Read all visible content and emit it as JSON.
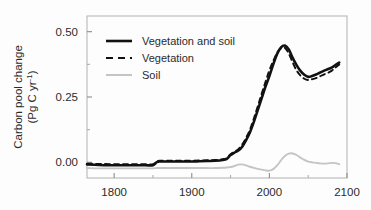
{
  "figure": {
    "background_color": "#fdfdfd",
    "frame_color": "#b9b9b9"
  },
  "axis": {
    "y_title_line1": "Carbon pool change",
    "y_title_line2_pre": "(Pg C yr",
    "y_title_line2_sup": "-1",
    "y_title_line2_post": ")",
    "y_ticks": [
      "0.00",
      "0.25",
      "0.50"
    ],
    "x_ticks": [
      "1800",
      "1900",
      "2000",
      "2100"
    ]
  },
  "legend": {
    "items": [
      {
        "label": "Vegetation and soil",
        "style": "solid",
        "color": "#111111",
        "width": 2.6
      },
      {
        "label": "Vegetation",
        "style": "dashed",
        "color": "#111111",
        "width": 2.0
      },
      {
        "label": "Soil",
        "style": "solid",
        "color": "#c4c4c4",
        "width": 2.0
      }
    ]
  },
  "chart_data": {
    "type": "line",
    "title": "",
    "xlabel": "",
    "ylabel": "Carbon pool change (Pg C yr-1)",
    "xlim": [
      1765,
      2100
    ],
    "ylim": [
      -0.06,
      0.56
    ],
    "grid": false,
    "legend_position": "upper-left-inside",
    "x_major_ticks": [
      1800,
      1900,
      2000,
      2100
    ],
    "x_minor_ticks": [
      1850,
      1950,
      2050
    ],
    "y_major_ticks": [
      0.0,
      0.25,
      0.5
    ],
    "y_minor_ticks": [
      0.125,
      0.375
    ],
    "x": [
      1765,
      1780,
      1795,
      1810,
      1825,
      1840,
      1850,
      1855,
      1860,
      1870,
      1880,
      1890,
      1900,
      1910,
      1920,
      1930,
      1940,
      1945,
      1950,
      1955,
      1960,
      1965,
      1970,
      1975,
      1980,
      1985,
      1990,
      1995,
      2000,
      2005,
      2010,
      2015,
      2020,
      2025,
      2030,
      2035,
      2040,
      2045,
      2050,
      2055,
      2060,
      2065,
      2070,
      2075,
      2080,
      2085,
      2090
    ],
    "series": [
      {
        "name": "Vegetation and soil",
        "style": "solid",
        "color": "#111111",
        "values": [
          -0.008,
          -0.01,
          -0.011,
          -0.011,
          -0.011,
          -0.011,
          -0.011,
          0.001,
          0.003,
          0.003,
          0.003,
          0.003,
          0.003,
          0.004,
          0.005,
          0.006,
          0.009,
          0.013,
          0.028,
          0.037,
          0.045,
          0.06,
          0.085,
          0.115,
          0.155,
          0.2,
          0.245,
          0.29,
          0.33,
          0.375,
          0.415,
          0.44,
          0.447,
          0.432,
          0.4,
          0.372,
          0.35,
          0.335,
          0.327,
          0.33,
          0.336,
          0.343,
          0.35,
          0.356,
          0.362,
          0.372,
          0.382
        ]
      },
      {
        "name": "Vegetation",
        "style": "dashed",
        "color": "#111111",
        "values": [
          -0.005,
          -0.006,
          -0.007,
          -0.007,
          -0.007,
          -0.007,
          -0.007,
          0.004,
          0.006,
          0.006,
          0.006,
          0.006,
          0.006,
          0.007,
          0.008,
          0.009,
          0.012,
          0.016,
          0.031,
          0.041,
          0.05,
          0.068,
          0.094,
          0.125,
          0.168,
          0.214,
          0.262,
          0.308,
          0.352,
          0.388,
          0.42,
          0.436,
          0.438,
          0.416,
          0.382,
          0.352,
          0.332,
          0.32,
          0.315,
          0.318,
          0.322,
          0.329,
          0.336,
          0.342,
          0.35,
          0.362,
          0.374
        ]
      },
      {
        "name": "Soil",
        "style": "solid",
        "color": "#c4c4c4",
        "values": [
          -0.022,
          -0.023,
          -0.023,
          -0.023,
          -0.023,
          -0.023,
          -0.023,
          -0.022,
          -0.022,
          -0.022,
          -0.022,
          -0.022,
          -0.022,
          -0.022,
          -0.022,
          -0.022,
          -0.021,
          -0.02,
          -0.018,
          -0.014,
          -0.009,
          -0.008,
          -0.012,
          -0.017,
          -0.021,
          -0.025,
          -0.028,
          -0.031,
          -0.032,
          -0.026,
          -0.012,
          0.008,
          0.024,
          0.033,
          0.034,
          0.028,
          0.018,
          0.009,
          0.003,
          0.0,
          -0.002,
          -0.004,
          -0.005,
          -0.004,
          -0.002,
          -0.003,
          -0.007
        ]
      }
    ]
  }
}
